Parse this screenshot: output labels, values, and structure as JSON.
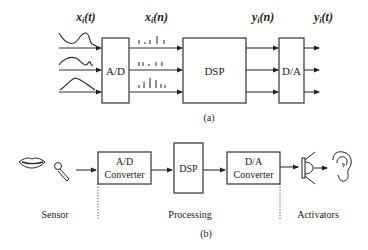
{
  "figure_a": {
    "caption": "(a)",
    "labels": {
      "analog_input": "x",
      "analog_input_sub": "i",
      "analog_input_arg": "(t)",
      "digital_input": "x",
      "digital_input_sub": "i",
      "digital_input_arg": "(n)",
      "digital_output": "y",
      "digital_output_sub": "i",
      "digital_output_arg": "(n)",
      "analog_output": "y",
      "analog_output_sub": "i",
      "analog_output_arg": "(t)"
    },
    "blocks": {
      "adc": "A/D",
      "dsp": "DSP",
      "dac": "D/A"
    },
    "channels": 3
  },
  "figure_b": {
    "caption": "(b)",
    "blocks": {
      "adc_line1": "A/D",
      "adc_line2": "Converter",
      "dsp": "DSP",
      "dac_line1": "D/A",
      "dac_line2": "Converter"
    },
    "stages": {
      "sensor": "Sensor",
      "processing": "Processing",
      "activators": "Activators"
    },
    "icons": [
      "lips-icon",
      "microphone-icon",
      "speaker-icon",
      "ear-icon"
    ]
  }
}
